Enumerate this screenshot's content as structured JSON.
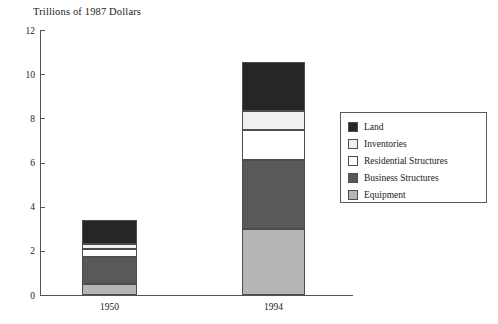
{
  "chart_data": {
    "type": "bar",
    "variant": "stacked",
    "title": "Trillions of 1987 Dollars",
    "xlabel": "",
    "ylabel": "",
    "ylim": [
      0,
      12
    ],
    "yticks": [
      0,
      2,
      4,
      6,
      8,
      10,
      12
    ],
    "ytick_labels": [
      "0",
      "2",
      "4",
      "6",
      "8",
      "10",
      "12"
    ],
    "grid": false,
    "legend_position": "right",
    "categories": [
      "1950",
      "1994"
    ],
    "series": [
      {
        "name": "Equipment",
        "color": "#b5b5b5",
        "values": [
          0.5,
          3.0
        ]
      },
      {
        "name": "Business Structures",
        "color": "#595959",
        "values": [
          1.2,
          3.1
        ]
      },
      {
        "name": "Residential Structures",
        "color": "#ffffff",
        "values": [
          0.4,
          1.35
        ]
      },
      {
        "name": "Inventories",
        "color": "#f0f0f0",
        "values": [
          0.2,
          0.9
        ]
      },
      {
        "name": "Land",
        "color": "#262626",
        "values": [
          1.1,
          2.2
        ]
      }
    ],
    "totals": [
      3.4,
      10.55
    ],
    "legend_entries": [
      {
        "label": "Land",
        "color": "#262626"
      },
      {
        "label": "Inventories",
        "color": "#f0f0f0"
      },
      {
        "label": "Residential Structures",
        "color": "#ffffff"
      },
      {
        "label": "Business Structures",
        "color": "#595959"
      },
      {
        "label": "Equipment",
        "color": "#b5b5b5"
      }
    ]
  }
}
